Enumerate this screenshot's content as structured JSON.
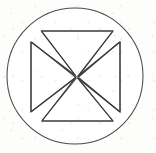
{
  "figure": {
    "title": "Cross pattée inscribed in a circle",
    "medium": "line-drawing",
    "canvas": {
      "width": 156,
      "height": 153,
      "background_color": "#fdfdfc"
    },
    "stroke": {
      "color": "#3a3a3a",
      "circle_color": "#4a4a4a",
      "width": 1.05,
      "fill_color": "#ffffff"
    },
    "circle": {
      "center_x": 75,
      "center_y": 76,
      "radius": 68
    },
    "cross": {
      "center_x": 76,
      "center_y": 77,
      "notch_inset": 4.5,
      "arms": {
        "top": {
          "y": 31,
          "x_outer_left": 41,
          "x_outer_right": 113,
          "x_inner_left": 56,
          "x_inner_right": 98
        },
        "bottom": {
          "y": 121,
          "x_outer_left": 42,
          "x_outer_right": 113,
          "x_inner_left": 56,
          "x_inner_right": 98
        },
        "left": {
          "x": 31,
          "y_outer_top": 42,
          "y_outer_bottom": 112,
          "y_inner_top": 56,
          "y_inner_bottom": 98
        },
        "right": {
          "x": 120,
          "y_outer_top": 42,
          "y_outer_bottom": 112,
          "y_inner_top": 56,
          "y_inner_bottom": 98
        }
      },
      "outline_points": "41,31 113,31 98,56 120,42 120,112 98,98 113,121 42,121 56,98 31,112 31,42 56,56"
    }
  }
}
